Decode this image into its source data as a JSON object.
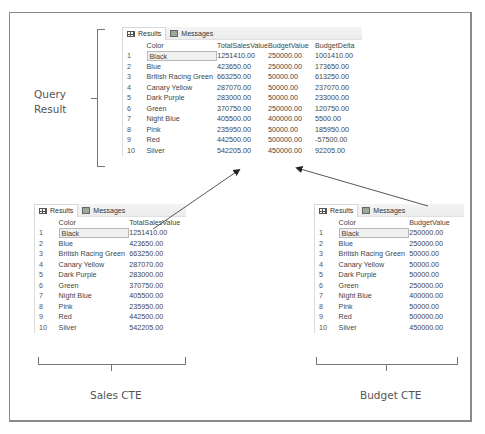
{
  "tabs": {
    "results": "Results",
    "messages": "Messages"
  },
  "labels": {
    "query_result_line1": "Query",
    "query_result_line2": "Result",
    "sales_cte": "Sales CTE",
    "budget_cte": "Budget CTE"
  },
  "query_result": {
    "headers": [
      "Color",
      "TotalSalesValue",
      "BudgetValue",
      "BudgetDelta"
    ],
    "rows": [
      [
        "1",
        "Black",
        "1251410.00",
        "250000.00",
        "1001410.00"
      ],
      [
        "2",
        "Blue",
        "423650.00",
        "250000.00",
        "173650.00"
      ],
      [
        "3",
        "British Racing Green",
        "663250.00",
        "50000.00",
        "613250.00"
      ],
      [
        "4",
        "Canary Yellow",
        "287070.00",
        "50000.00",
        "237070.00"
      ],
      [
        "5",
        "Dark Purple",
        "283000.00",
        "50000.00",
        "233000.00"
      ],
      [
        "6",
        "Green",
        "370750.00",
        "250000.00",
        "120750.00"
      ],
      [
        "7",
        "Night Blue",
        "405500.00",
        "400000.00",
        "5500.00"
      ],
      [
        "8",
        "Pink",
        "235950.00",
        "50000.00",
        "185950.00"
      ],
      [
        "9",
        "Red",
        "442500.00",
        "500000.00",
        "-57500.00"
      ],
      [
        "10",
        "Silver",
        "542205.00",
        "450000.00",
        "92205.00"
      ]
    ]
  },
  "sales_cte": {
    "headers": [
      "Color",
      "TotalSalesValue"
    ],
    "rows": [
      [
        "1",
        "Black",
        "1251410.00"
      ],
      [
        "2",
        "Blue",
        "423650.00"
      ],
      [
        "3",
        "British Racing Green",
        "663250.00"
      ],
      [
        "4",
        "Canary Yellow",
        "287070.00"
      ],
      [
        "5",
        "Dark Purple",
        "283000.00"
      ],
      [
        "6",
        "Green",
        "370750.00"
      ],
      [
        "7",
        "Night Blue",
        "405500.00"
      ],
      [
        "8",
        "Pink",
        "235950.00"
      ],
      [
        "9",
        "Red",
        "442500.00"
      ],
      [
        "10",
        "Silver",
        "542205.00"
      ]
    ]
  },
  "budget_cte": {
    "headers": [
      "Color",
      "BudgetValue"
    ],
    "rows": [
      [
        "1",
        "Black",
        "250000.00"
      ],
      [
        "2",
        "Blue",
        "250000.00"
      ],
      [
        "3",
        "British Racing Green",
        "50000.00"
      ],
      [
        "4",
        "Canary Yellow",
        "50000.00"
      ],
      [
        "5",
        "Dark Purple",
        "50000.00"
      ],
      [
        "6",
        "Green",
        "250000.00"
      ],
      [
        "7",
        "Night Blue",
        "400000.00"
      ],
      [
        "8",
        "Pink",
        "50000.00"
      ],
      [
        "9",
        "Red",
        "500000.00"
      ],
      [
        "10",
        "Silver",
        "450000.00"
      ]
    ]
  }
}
